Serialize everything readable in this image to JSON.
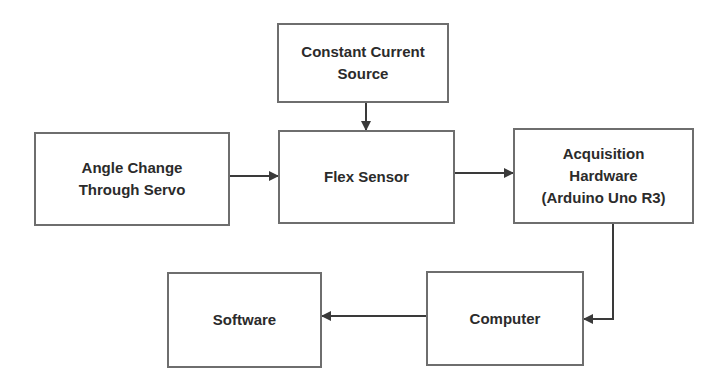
{
  "diagram": {
    "type": "block-diagram",
    "colors": {
      "border": "#6e6e6e",
      "text": "#2b2b2b",
      "arrow": "#3a3a3a",
      "background": "#ffffff"
    },
    "nodes": [
      {
        "id": "ccs",
        "label": "Constant Current\nSource"
      },
      {
        "id": "angle",
        "label": "Angle Change\nThrough Servo"
      },
      {
        "id": "flex",
        "label": "Flex Sensor"
      },
      {
        "id": "acq",
        "label": "Acquisition\nHardware\n(Arduino Uno R3)"
      },
      {
        "id": "computer",
        "label": "Computer"
      },
      {
        "id": "software",
        "label": "Software"
      }
    ],
    "edges": [
      {
        "from": "ccs",
        "to": "flex"
      },
      {
        "from": "angle",
        "to": "flex"
      },
      {
        "from": "flex",
        "to": "acq"
      },
      {
        "from": "acq",
        "to": "computer"
      },
      {
        "from": "computer",
        "to": "software"
      }
    ]
  }
}
